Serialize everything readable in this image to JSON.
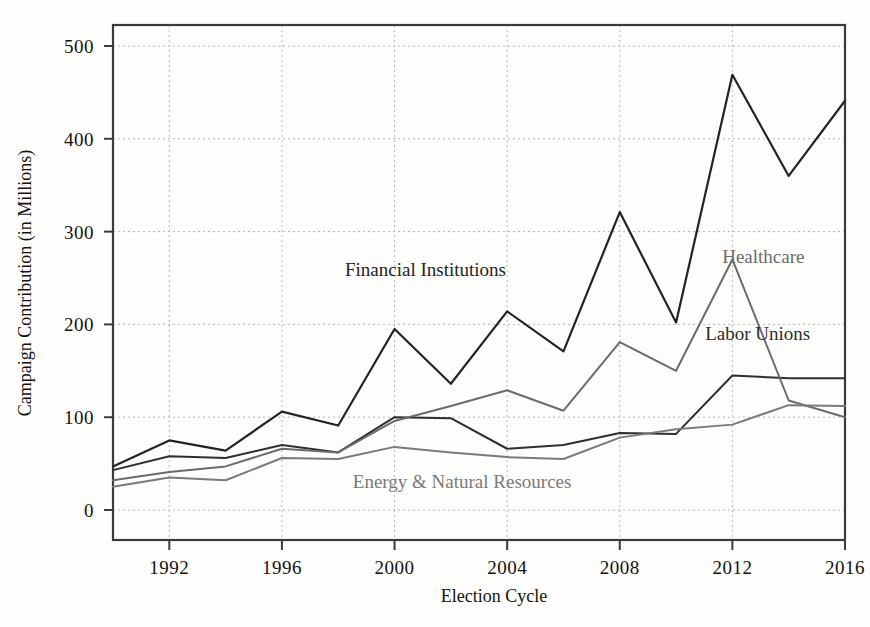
{
  "chart_data": {
    "type": "line",
    "title": "",
    "xlabel": "Election Cycle",
    "ylabel": "Campaign Contribution (in Millions)",
    "x": [
      1990,
      1992,
      1994,
      1996,
      1998,
      2000,
      2002,
      2004,
      2006,
      2008,
      2010,
      2012,
      2014,
      2016
    ],
    "xlim": [
      1990,
      2016
    ],
    "ylim": [
      0,
      530
    ],
    "xticks": [
      1992,
      1996,
      2000,
      2004,
      2008,
      2012,
      2016
    ],
    "xtick_labels": [
      "1992",
      "1996",
      "2000",
      "2004",
      "2008",
      "2012",
      "2016"
    ],
    "yticks": [
      0,
      100,
      200,
      300,
      400,
      500
    ],
    "ytick_labels": [
      "0",
      "100",
      "200",
      "300",
      "400",
      "500"
    ],
    "grid": true,
    "legend_position": "inline-annotations",
    "series": [
      {
        "name": "Financial Institutions",
        "color": "#232323",
        "width": 2.2,
        "values": [
          47,
          75,
          64,
          106,
          91,
          195,
          136,
          214,
          171,
          321,
          202,
          469,
          360,
          441
        ],
        "label_x": 2001.1,
        "label_y": 252,
        "label_anchor": "middle"
      },
      {
        "name": "Labor Unions",
        "color": "#2e2e2e",
        "width": 2.0,
        "values": [
          43,
          58,
          56,
          70,
          62,
          100,
          99,
          66,
          70,
          83,
          82,
          145,
          142,
          142
        ],
        "label_x": 2012.9,
        "label_y": 183,
        "label_anchor": "middle"
      },
      {
        "name": "Healthcare",
        "color": "#6b6b6b",
        "width": 2.0,
        "values": [
          32,
          41,
          47,
          66,
          62,
          96,
          112,
          129,
          107,
          181,
          150,
          270,
          118,
          100
        ],
        "label_x": 2013.1,
        "label_y": 266,
        "label_anchor": "middle"
      },
      {
        "name": "Energy & Natural Resources",
        "color": "#7a7a7a",
        "width": 2.0,
        "values": [
          25,
          35,
          32,
          56,
          55,
          68,
          62,
          57,
          55,
          78,
          87,
          92,
          113,
          112
        ],
        "label_x": 2002.4,
        "label_y": 24,
        "label_anchor": "middle"
      }
    ]
  },
  "geometry": {
    "plot_left": 113,
    "plot_right": 845,
    "plot_top": 25,
    "plot_bottom": 540,
    "y_zero_px": 510,
    "px_per_unit": 0.928
  }
}
